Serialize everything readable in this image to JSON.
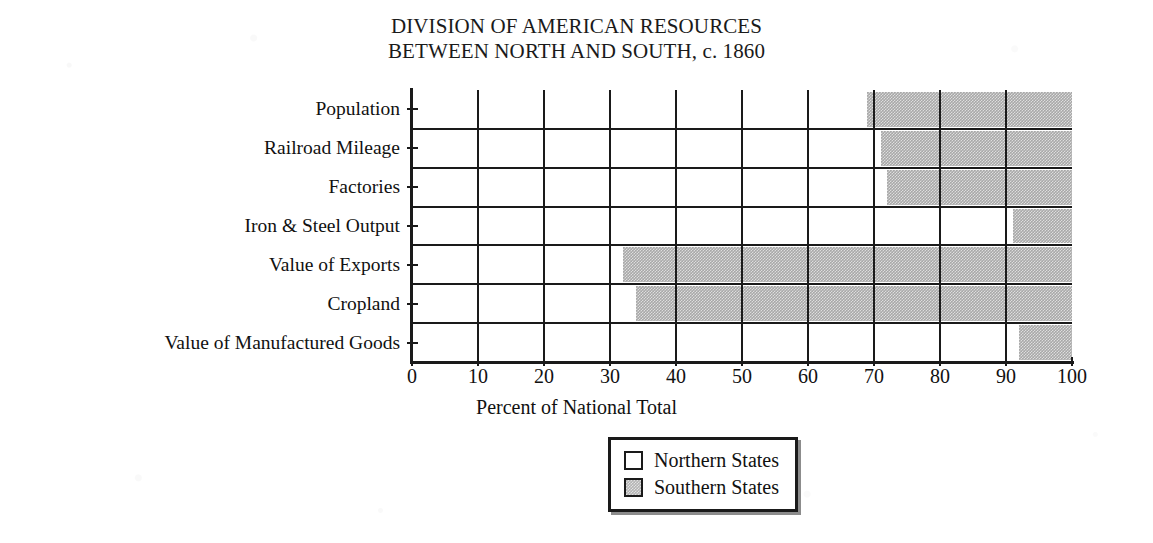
{
  "chart_data": {
    "type": "bar",
    "orientation": "horizontal",
    "stacked": true,
    "normalized_percent": true,
    "title": "DIVISION OF AMERICAN RESOURCES BETWEEN NORTH AND SOUTH, c. 1860",
    "title_lines": [
      "DIVISION OF AMERICAN RESOURCES",
      "BETWEEN NORTH AND SOUTH, c. 1860"
    ],
    "xlabel": "Percent of National Total",
    "ylabel": "",
    "xlim": [
      0,
      100
    ],
    "xticks": [
      0,
      10,
      20,
      30,
      40,
      50,
      60,
      70,
      80,
      90,
      100
    ],
    "xtick_labels": [
      "0",
      "10",
      "20",
      "30",
      "40",
      "50",
      "60",
      "70",
      "80",
      "90",
      "100"
    ],
    "grid": true,
    "grid_axis": "both",
    "legend_position": "bottom-center",
    "categories": [
      "Population",
      "Railroad Mileage",
      "Factories",
      "Iron & Steel Output",
      "Value of Exports",
      "Cropland",
      "Value of Manufactured Goods"
    ],
    "series": [
      {
        "name": "Northern States",
        "color": "#ffffff",
        "values": [
          69,
          71,
          72,
          91,
          32,
          34,
          92
        ]
      },
      {
        "name": "Southern States",
        "color": "#a8a8a8",
        "values": [
          31,
          29,
          28,
          9,
          68,
          66,
          8
        ]
      }
    ]
  },
  "legend": {
    "entries": [
      {
        "label": "Northern States",
        "swatch": "north"
      },
      {
        "label": "Southern States",
        "swatch": "south"
      }
    ]
  },
  "colors": {
    "north": "#ffffff",
    "south": "#a8a8a8",
    "ink": "#1a1a1a",
    "paper": "#ffffff"
  }
}
